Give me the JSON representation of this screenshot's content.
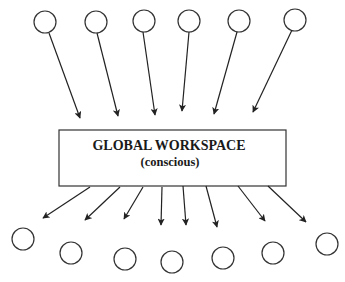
{
  "workspace": {
    "title": "GLOBAL WORKSPACE",
    "subtitle": "(conscious)",
    "box": {
      "x": 59,
      "y": 130,
      "w": 227,
      "h": 56
    }
  },
  "colors": {
    "stroke": "#333333",
    "background": "#ffffff",
    "text": "#1a1a1a"
  },
  "input_nodes": [
    {
      "cx": 45,
      "cy": 22,
      "r": 11,
      "line_start": [
        49,
        33
      ],
      "tip": [
        80,
        118
      ]
    },
    {
      "cx": 96,
      "cy": 22,
      "r": 11,
      "line_start": [
        97,
        33
      ],
      "tip": [
        118,
        116
      ]
    },
    {
      "cx": 144,
      "cy": 21,
      "r": 11,
      "line_start": [
        143,
        32
      ],
      "tip": [
        155,
        115
      ]
    },
    {
      "cx": 189,
      "cy": 21,
      "r": 11,
      "line_start": [
        189,
        32
      ],
      "tip": [
        182,
        111
      ]
    },
    {
      "cx": 239,
      "cy": 21,
      "r": 11,
      "line_start": [
        237,
        32
      ],
      "tip": [
        214,
        114
      ]
    },
    {
      "cx": 295,
      "cy": 20,
      "r": 11,
      "line_start": [
        292,
        30
      ],
      "tip": [
        253,
        112
      ]
    }
  ],
  "output_arrows": [
    {
      "start": [
        90,
        187
      ],
      "tip": [
        43,
        218
      ]
    },
    {
      "start": [
        120,
        187
      ],
      "tip": [
        85,
        220
      ]
    },
    {
      "start": [
        143,
        187
      ],
      "tip": [
        124,
        219
      ]
    },
    {
      "start": [
        162,
        187
      ],
      "tip": [
        161,
        225
      ]
    },
    {
      "start": [
        183,
        186
      ],
      "tip": [
        186,
        225
      ]
    },
    {
      "start": [
        206,
        186
      ],
      "tip": [
        217,
        227
      ]
    },
    {
      "start": [
        238,
        186
      ],
      "tip": [
        265,
        221
      ]
    },
    {
      "start": [
        268,
        186
      ],
      "tip": [
        306,
        222
      ]
    }
  ],
  "output_nodes": [
    {
      "cx": 23,
      "cy": 239,
      "r": 11
    },
    {
      "cx": 71,
      "cy": 253,
      "r": 11
    },
    {
      "cx": 125,
      "cy": 259,
      "r": 11
    },
    {
      "cx": 172,
      "cy": 262,
      "r": 11
    },
    {
      "cx": 223,
      "cy": 258,
      "r": 11
    },
    {
      "cx": 273,
      "cy": 253,
      "r": 11
    },
    {
      "cx": 327,
      "cy": 244,
      "r": 11
    }
  ]
}
